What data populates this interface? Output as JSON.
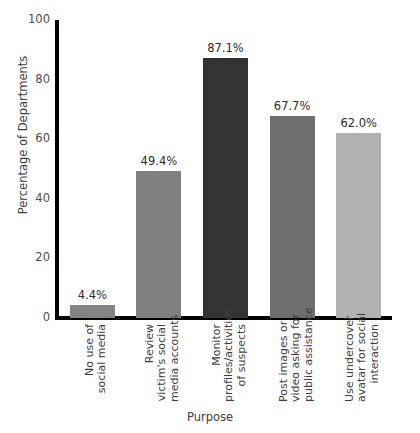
{
  "chart_data": {
    "type": "bar",
    "title": "",
    "xlabel": "Purpose",
    "ylabel": "Percentage of Departments",
    "ylim": [
      0,
      100
    ],
    "yticks": [
      0,
      20,
      40,
      60,
      80,
      100
    ],
    "ytick_labels": [
      "0",
      "20",
      "40",
      "60",
      "80",
      "100"
    ],
    "grid": false,
    "legend": false,
    "categories": [
      "No use of\nsocial media",
      "Review\nvictim's social\nmedia accounts",
      "Monitor\nprofiles/activities\nof suspects",
      "Post images or\nvideo asking for\npublic assistance",
      "Use undercover\navatar for social\ninteraction"
    ],
    "values": [
      4.4,
      49.4,
      87.1,
      67.7,
      62.0
    ],
    "value_labels": [
      "4.4%",
      "49.4%",
      "87.1%",
      "67.7%",
      "62.0%"
    ],
    "bar_colors": [
      "#848484",
      "#808080",
      "#333333",
      "#6f6f6f",
      "#b2b2b2"
    ],
    "axis_color": "#000000",
    "background": "#ffffff"
  }
}
